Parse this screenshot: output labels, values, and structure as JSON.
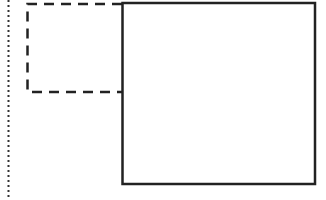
{
  "diagram": {
    "background": "#ffffff",
    "stroke_color": "#222222",
    "guide_line": {
      "style": "dotted",
      "x": 8,
      "y1": 0,
      "y2": 200
    },
    "dashed_box": {
      "style": "dashed",
      "x": 27,
      "y": 4,
      "width": 95,
      "height": 88
    },
    "solid_box": {
      "style": "solid",
      "x": 122,
      "y": 3,
      "width": 193,
      "height": 181
    }
  }
}
